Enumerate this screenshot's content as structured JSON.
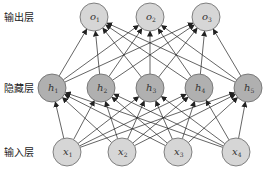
{
  "diagram": {
    "type": "neural-network",
    "colors": {
      "light_node": "#d6d6d6",
      "dark_node": "#b0b0b0",
      "stroke": "#666666",
      "edge": "#222222"
    },
    "layers": [
      {
        "id": "output",
        "label": "输出层",
        "y": 17,
        "shade": "light",
        "nodes": [
          {
            "name": "o",
            "sub": "1",
            "x": 94
          },
          {
            "name": "o",
            "sub": "2",
            "x": 150
          },
          {
            "name": "o",
            "sub": "3",
            "x": 206
          }
        ]
      },
      {
        "id": "hidden",
        "label": "隐藏层",
        "y": 88,
        "shade": "dark",
        "nodes": [
          {
            "name": "h",
            "sub": "1",
            "x": 52
          },
          {
            "name": "h",
            "sub": "2",
            "x": 101
          },
          {
            "name": "h",
            "sub": "3",
            "x": 150
          },
          {
            "name": "h",
            "sub": "4",
            "x": 199
          },
          {
            "name": "h",
            "sub": "5",
            "x": 248
          }
        ]
      },
      {
        "id": "input",
        "label": "输入层",
        "y": 152,
        "shade": "light",
        "nodes": [
          {
            "name": "x",
            "sub": "1",
            "x": 67
          },
          {
            "name": "x",
            "sub": "2",
            "x": 122
          },
          {
            "name": "x",
            "sub": "3",
            "x": 178
          },
          {
            "name": "x",
            "sub": "4",
            "x": 236
          }
        ]
      }
    ],
    "connections": "fully-connected, arrows from input to hidden and hidden to output",
    "node_radius": 14
  }
}
